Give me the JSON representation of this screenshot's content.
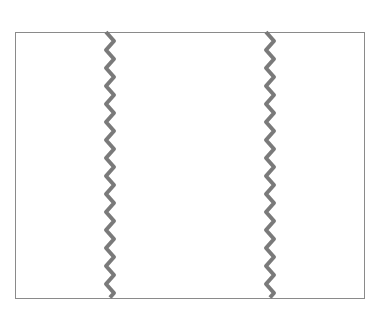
{
  "diagram": {
    "frame": {
      "left": 15,
      "top": 32,
      "right": 365,
      "bottom": 299,
      "border_color": "#8a8a8a"
    },
    "break_lines": [
      {
        "name": "left-break",
        "x_center": 110,
        "amplitude": 4,
        "period": 18,
        "color": "#7a7a7a",
        "stroke_width": 4
      },
      {
        "name": "right-break",
        "x_center": 270,
        "amplitude": 4,
        "period": 18,
        "color": "#7a7a7a",
        "stroke_width": 4
      }
    ]
  }
}
